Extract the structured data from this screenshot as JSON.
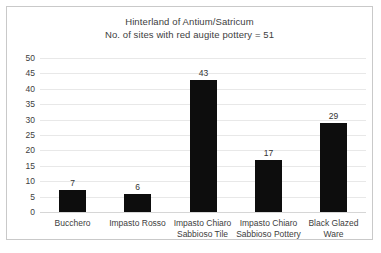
{
  "chart_data": {
    "type": "bar",
    "title": "Hinterland of Antium/Satricum",
    "subtitle": "No. of sites with red augite pottery = 51",
    "xlabel": "",
    "ylabel": "",
    "ylim": [
      0,
      50
    ],
    "ytick_step": 5,
    "yticks": [
      "50",
      "45",
      "40",
      "35",
      "30",
      "25",
      "20",
      "15",
      "10",
      "5",
      "0"
    ],
    "grid": true,
    "legend": false,
    "bar_color": "#0d0d0d",
    "gridline_color": "#e8e8e8",
    "categories": [
      "Bucchero",
      "Impasto Rosso",
      "Impasto Chiaro Sabbioso Tile",
      "Impasto Chiaro Sabbioso Pottery",
      "Black Glazed Ware"
    ],
    "category_label_lines": [
      [
        "Bucchero"
      ],
      [
        "Impasto Rosso"
      ],
      [
        "Impasto Chiaro",
        "Sabbioso Tile"
      ],
      [
        "Impasto Chiaro",
        "Sabbioso Pottery"
      ],
      [
        "Black Glazed",
        "Ware"
      ]
    ],
    "values": [
      7,
      6,
      43,
      17,
      29
    ],
    "value_labels": [
      "7",
      "6",
      "43",
      "17",
      "29"
    ]
  }
}
